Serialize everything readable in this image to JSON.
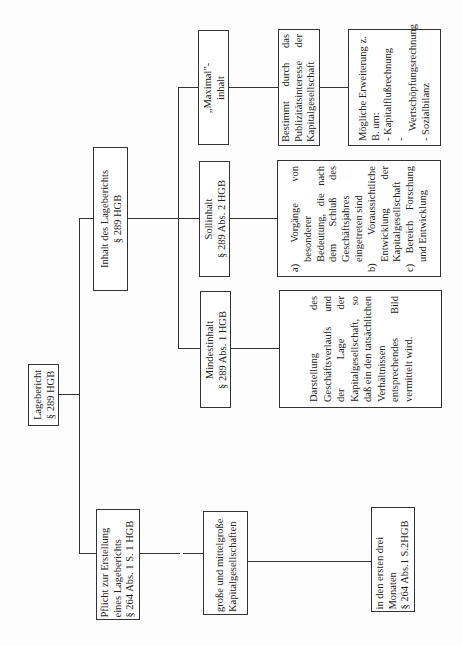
{
  "root": {
    "line1": "Lagebericht",
    "line2": "§ 289 HGB"
  },
  "pflicht": {
    "line1": "Pflicht zur Erstellung",
    "line2": "eines Lageberichts",
    "line3": "§ 264 Abs. 1 S. 1 HGB"
  },
  "gesellschaften": {
    "line1": "große und mittelgroße",
    "line2": "Kapitalgesellschaften"
  },
  "frist": {
    "line1": "in den ersten drei",
    "line2": "Monaten",
    "line3": "§ 264 Abs.1 S.2HGB"
  },
  "inhalt": {
    "line1": "Inhalt des Lageberichts",
    "line2": "§ 289 HGB"
  },
  "mindestinhalt": {
    "line1": "Mindestinhalt",
    "line2": "§ 289 Abs. 1 HGB",
    "description": "Darstellung des Geschäftsverlaufs und der Lage der Kapitalgesellschaft, so daß ein den tatsächlichen Verhältnissen entsprechendes Bild vermittelt wird."
  },
  "sollinhalt": {
    "line1": "Sollinhalt",
    "line2": "§ 289 Abs. 2 HGB",
    "items": [
      "a) Vorgänge von besonderer Bedeutung, die nach dem Schluß des Geschäftsjahres eingetreten sind",
      "b) Voraussichtliche Entwicklung der Kapitalgesellschaft",
      "c) Bereich Forschung und Entwicklung"
    ]
  },
  "maximalinhalt": {
    "line1": "„Maximal\"-",
    "line2": "inhalt",
    "description": "Bestimmt durch das Publizitätsinteresse der Kapitalgesellschaft",
    "extension": {
      "title": "Mögliche Erweiterung z. B. um:",
      "items": [
        "- Kapitalflußrechnung",
        "- Wertschöpfungsrechnung",
        "- Sozialbilanz"
      ]
    }
  }
}
